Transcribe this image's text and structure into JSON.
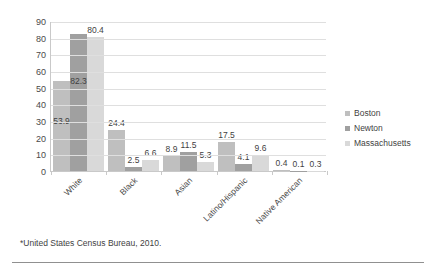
{
  "footnote": "*United States Census Bureau, 2010.",
  "legend": {
    "position": "right",
    "items": [
      {
        "label": "Boston",
        "color": "#bfbfbf"
      },
      {
        "label": "Newton",
        "color": "#a0a0a0"
      },
      {
        "label": "Massachusetts",
        "color": "#d9d9d9"
      }
    ]
  },
  "chart_data": {
    "type": "bar",
    "title": "",
    "subtitle": "",
    "xlabel": "",
    "ylabel": "",
    "ylim": [
      0,
      90
    ],
    "yticks": [
      0,
      10,
      20,
      30,
      40,
      50,
      60,
      70,
      80,
      90
    ],
    "ytick_labels": [
      "0",
      "10",
      "20",
      "30",
      "40",
      "50",
      "60",
      "70",
      "80",
      "90"
    ],
    "grid": true,
    "legend_position": "right",
    "categories": [
      "White",
      "Black",
      "Asian",
      "Latino/Hispanic",
      "Native American"
    ],
    "series": [
      {
        "name": "Boston",
        "color": "#bfbfbf",
        "values": [
          53.9,
          24.4,
          8.9,
          17.5,
          0.4
        ],
        "labels": [
          "53.9",
          "24.4",
          "8.9",
          "17.5",
          "0.4"
        ]
      },
      {
        "name": "Newton",
        "color": "#a0a0a0",
        "values": [
          82.3,
          2.5,
          11.5,
          4.1,
          0.1
        ],
        "labels": [
          "82.3",
          "2.5",
          "11.5",
          "4.1",
          "0.1"
        ]
      },
      {
        "name": "Massachusetts",
        "color": "#d9d9d9",
        "values": [
          80.4,
          6.6,
          5.3,
          9.6,
          0.3
        ],
        "labels": [
          "80.4",
          "6.6",
          "5.3",
          "9.6",
          "0.3"
        ]
      }
    ],
    "annotations": [
      "*United States Census Bureau, 2010."
    ]
  }
}
